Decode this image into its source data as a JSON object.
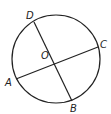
{
  "diagram": {
    "type": "circle-geometry",
    "stroke_color": "#222222",
    "background": "#ffffff",
    "circle": {
      "center_label": "O",
      "cx": 56,
      "cy": 59,
      "r": 44
    },
    "points": {
      "A": {
        "label": "A",
        "x": 16,
        "y": 79
      },
      "B": {
        "label": "B",
        "x": 72,
        "y": 101
      },
      "C": {
        "label": "C",
        "x": 98,
        "y": 47
      },
      "D": {
        "label": "D",
        "x": 34,
        "y": 22
      },
      "O": {
        "label": "O",
        "x": 57,
        "y": 61
      }
    },
    "segments": [
      {
        "name": "AC",
        "from": "A",
        "to": "C"
      },
      {
        "name": "DB",
        "from": "D",
        "to": "B"
      }
    ],
    "labels": {
      "A": "A",
      "B": "B",
      "C": "C",
      "D": "D",
      "O": "O"
    }
  }
}
